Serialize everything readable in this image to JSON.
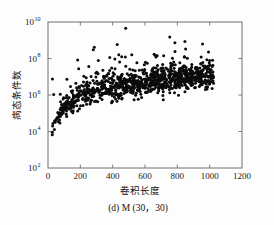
{
  "figure": {
    "caption": "(d) M (30，30)",
    "background_color": "#fdfdfd",
    "axis_color": "#6f6f6f",
    "point_color": "#0b0b0b"
  },
  "chart_data": {
    "type": "scatter",
    "title": "",
    "subtitle": "",
    "caption": "(d) M (30，30)",
    "xlabel": "卷积长度",
    "ylabel": "病态条件数",
    "xlim": [
      0,
      1200
    ],
    "ylim": [
      100,
      10000000000
    ],
    "yscale": "log",
    "xscale": "linear",
    "grid": false,
    "legend": null,
    "xticks": [
      0,
      200,
      400,
      600,
      800,
      1000,
      1200
    ],
    "xticklabels": [
      "0",
      "200",
      "400",
      "600",
      "800",
      "1000",
      "1200"
    ],
    "yticks": [
      100,
      10000,
      1000000,
      100000000,
      10000000000
    ],
    "yticklabels": [
      "10",
      "10",
      "10",
      "10",
      "10"
    ],
    "ytick_exponents": [
      "2",
      "4",
      "6",
      "8",
      "10"
    ],
    "marker": "dot",
    "marker_size": 1.5,
    "n_points": 1000,
    "x_range_data": [
      15,
      1025
    ],
    "y_range_data": [
      3000,
      9000000000
    ],
    "trend_description": "Condition number rises steeply with convolution length for short lengths then flattens; dense band from ~3e3 at x=20 up to ~1e7 near x=1000, with sparse outliers reaching ~9e9.",
    "band_center_points": [
      {
        "x": 20,
        "y": 8000
      },
      {
        "x": 50,
        "y": 40000
      },
      {
        "x": 100,
        "y": 200000
      },
      {
        "x": 200,
        "y": 900000
      },
      {
        "x": 300,
        "y": 2000000
      },
      {
        "x": 400,
        "y": 3000000
      },
      {
        "x": 500,
        "y": 4000000
      },
      {
        "x": 600,
        "y": 5000000
      },
      {
        "x": 700,
        "y": 7000000
      },
      {
        "x": 800,
        "y": 9000000
      },
      {
        "x": 900,
        "y": 11000000
      },
      {
        "x": 1000,
        "y": 13000000
      }
    ],
    "band_spread_decades": 0.85,
    "outlier_fraction": 0.06
  }
}
